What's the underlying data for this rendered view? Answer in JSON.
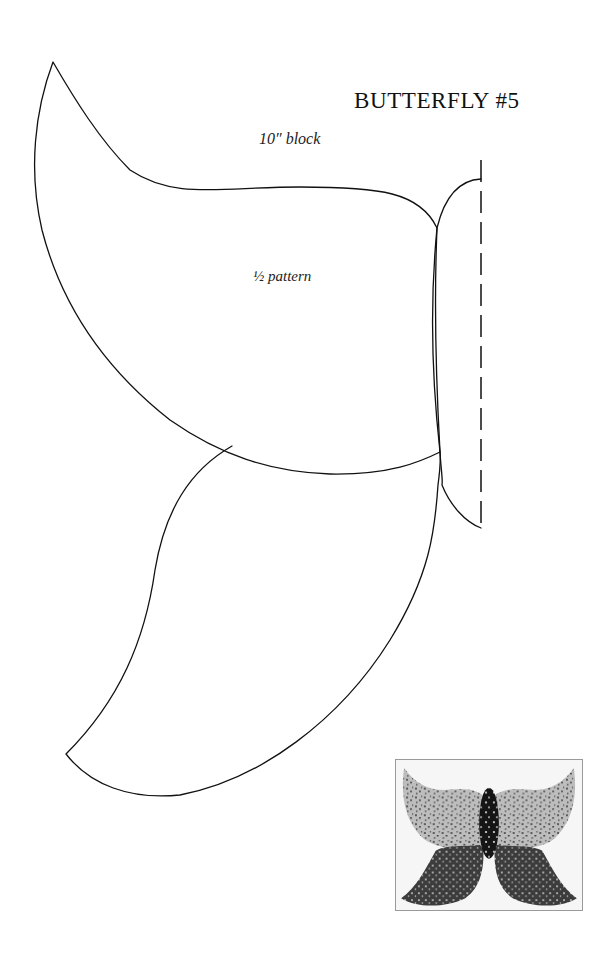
{
  "header": {
    "title": "BUTTERFLY #5",
    "subtitle": "10″ block"
  },
  "pattern": {
    "label": "½ pattern",
    "pieces": [
      "upper-wing",
      "lower-wing",
      "body"
    ],
    "fold_line": "dashed center line",
    "stroke_color": "#111111"
  },
  "inset_photo": {
    "description": "Finished butterfly quilt block",
    "colors": {
      "background": "#f6f6f6",
      "upper_wing_fabric": "#bdbdbd",
      "upper_wing_print": "#5a5a5a",
      "lower_wing_fabric": "#3c3c3c",
      "lower_wing_dots": "#d8d8d8",
      "body_fabric": "#151515",
      "body_dots": "#e0e0e0"
    }
  }
}
